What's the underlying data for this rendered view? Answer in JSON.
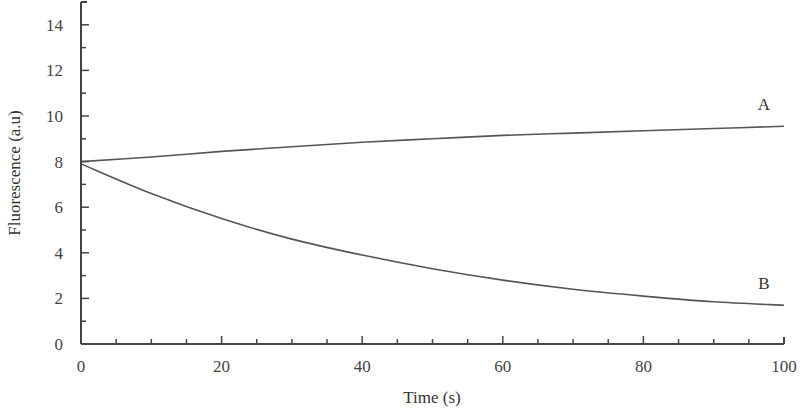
{
  "chart_data": {
    "type": "line",
    "title": "",
    "xlabel": "Time (s)",
    "ylabel": "Fluorescence (a.u)",
    "xlim": [
      0,
      100
    ],
    "ylim": [
      0,
      15
    ],
    "x_ticks": [
      0,
      20,
      40,
      60,
      80,
      100
    ],
    "y_ticks": [
      0,
      2,
      4,
      6,
      8,
      10,
      12,
      14
    ],
    "x_tick_labels": [
      "0",
      "20",
      "40",
      "60",
      "80",
      "100"
    ],
    "y_tick_labels": [
      "0",
      "2",
      "4",
      "6",
      "8",
      "10",
      "12",
      "14"
    ],
    "grid": false,
    "legend": "inline labels at line ends",
    "x": [
      0,
      10,
      20,
      30,
      40,
      50,
      60,
      70,
      80,
      90,
      100
    ],
    "series": [
      {
        "name": "A",
        "values": [
          8.0,
          8.2,
          8.45,
          8.65,
          8.85,
          9.0,
          9.15,
          9.25,
          9.35,
          9.45,
          9.55
        ]
      },
      {
        "name": "B",
        "values": [
          7.9,
          6.6,
          5.5,
          4.6,
          3.9,
          3.3,
          2.8,
          2.4,
          2.1,
          1.85,
          1.7
        ]
      }
    ],
    "line_color": "#555555"
  }
}
